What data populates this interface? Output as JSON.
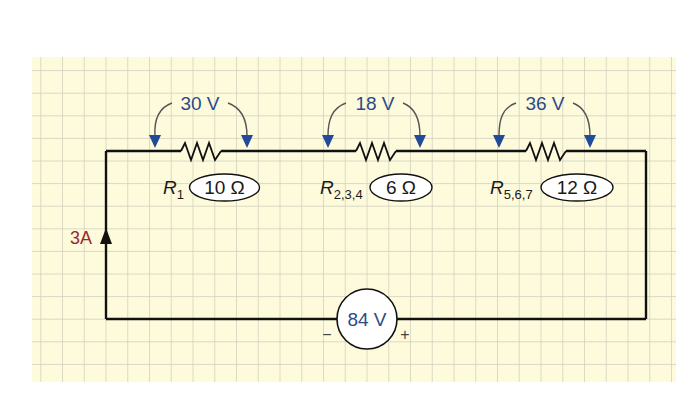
{
  "diagram": {
    "type": "series-circuit",
    "colors": {
      "paper": "#fdfbdc",
      "grid": "#cfcdbb",
      "wire": "#111111",
      "arrow": "#1f4b9a",
      "voltage_text": "#2a4a8a",
      "current_text": "#9a2a2a"
    },
    "current": {
      "label": "3A",
      "direction": "up"
    },
    "source": {
      "label": "84 V",
      "minus": "−",
      "plus": "+"
    },
    "resistors": [
      {
        "name": "R",
        "subscript": "1",
        "value": "10 Ω",
        "voltage_drop": "30 V"
      },
      {
        "name": "R",
        "subscript": "2,3,4",
        "value": "6 Ω",
        "voltage_drop": "18 V"
      },
      {
        "name": "R",
        "subscript": "5,6,7",
        "value": "12 Ω",
        "voltage_drop": "36 V"
      }
    ]
  }
}
